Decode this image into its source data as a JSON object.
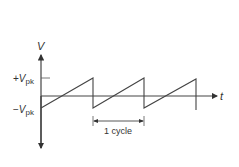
{
  "diagram": {
    "axis_y_label": "V",
    "axis_x_label": "t",
    "pos_peak_label": {
      "prefix": "+",
      "main": "V",
      "sub": "pk"
    },
    "neg_peak_label": {
      "prefix": "−",
      "main": "V",
      "sub": "pk"
    },
    "cycle_label": "1 cycle",
    "colors": {
      "axis": "#333333",
      "wave": "#444444",
      "text": "#333333"
    },
    "cycles_shown": 3
  }
}
